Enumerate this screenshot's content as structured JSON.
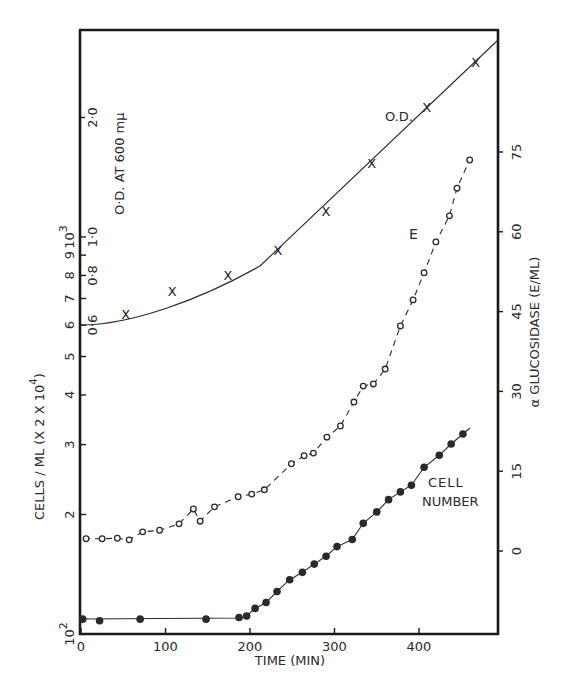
{
  "chart_data": {
    "type": "scatter",
    "title": "",
    "xlabel": "TIME (MIN)",
    "xlim": [
      0,
      494
    ],
    "x_ticks": [
      "0",
      "100",
      "200",
      "300",
      "400"
    ],
    "left_axis": {
      "label": "CELLS / ML (X 2 X 10⁴)",
      "scale": "log",
      "ticks": [
        "10²",
        "2",
        "3",
        "4",
        "5",
        "6",
        "7",
        "8",
        "9",
        "10³"
      ],
      "range": [
        100,
        3000
      ]
    },
    "od_axis": {
      "label": "O.D. AT 600 mμ",
      "scale": "log",
      "ticks": [
        "0.6",
        "0.8",
        "1.0",
        "2.0"
      ]
    },
    "right_axis": {
      "label": "α GLUCOSIDASE (E/ML)",
      "scale": "linear",
      "ticks": [
        "0",
        "15",
        "30",
        "45",
        "60",
        "75"
      ],
      "range": [
        -16,
        97
      ]
    },
    "annotations": [
      "O.D.",
      "E",
      "CELL",
      "NUMBER"
    ],
    "series": [
      {
        "name": "O.D.",
        "marker": "x",
        "axis": "od",
        "line": "solid",
        "points": [
          [
            53,
            0.64
          ],
          [
            108,
            0.73
          ],
          [
            174,
            0.8
          ],
          [
            233,
            0.93
          ],
          [
            290,
            1.16
          ],
          [
            344,
            1.54
          ],
          [
            409,
            2.12
          ],
          [
            467,
            2.76
          ]
        ]
      },
      {
        "name": "E",
        "marker": "open-circle",
        "axis": "right",
        "line": "dashed",
        "points": [
          [
            6,
            2.3
          ],
          [
            25,
            2.3
          ],
          [
            43,
            2.4
          ],
          [
            57,
            2.1
          ],
          [
            73,
            3.6
          ],
          [
            93,
            3.9
          ],
          [
            116,
            5.1
          ],
          [
            133,
            7.9
          ],
          [
            141,
            5.6
          ],
          [
            158,
            8.3
          ],
          [
            186,
            10.2
          ],
          [
            202,
            10.7
          ],
          [
            217,
            11.5
          ],
          [
            249,
            16.4
          ],
          [
            264,
            17.9
          ],
          [
            275,
            18.4
          ],
          [
            291,
            21.4
          ],
          [
            307,
            23.5
          ],
          [
            323,
            28.0
          ],
          [
            334,
            31.0
          ],
          [
            346,
            31.4
          ],
          [
            360,
            34.2
          ],
          [
            378,
            42.3
          ],
          [
            393,
            47.2
          ],
          [
            406,
            52.3
          ],
          [
            420,
            58.1
          ],
          [
            436,
            63.0
          ],
          [
            445,
            68.2
          ],
          [
            460,
            73.5
          ]
        ]
      },
      {
        "name": "CELL NUMBER",
        "marker": "filled-circle",
        "axis": "left",
        "line": "solid",
        "points": [
          [
            2,
            109
          ],
          [
            22,
            108
          ],
          [
            70,
            109
          ],
          [
            148,
            109
          ],
          [
            187,
            110
          ],
          [
            196,
            111
          ],
          [
            206,
            116
          ],
          [
            219,
            120
          ],
          [
            232,
            128
          ],
          [
            247,
            137
          ],
          [
            262,
            143
          ],
          [
            276,
            150
          ],
          [
            290,
            157
          ],
          [
            303,
            166
          ],
          [
            321,
            173
          ],
          [
            334,
            190
          ],
          [
            350,
            203
          ],
          [
            364,
            218
          ],
          [
            378,
            228
          ],
          [
            391,
            237
          ],
          [
            406,
            263
          ],
          [
            424,
            282
          ],
          [
            438,
            301
          ],
          [
            452,
            319
          ]
        ]
      }
    ]
  },
  "labels": {
    "xlabel": "TIME (MIN)",
    "left_axis_label": "CELLS / ML  (X 2 X 10",
    "left_axis_exp": "4",
    "left_axis_close": ")",
    "od_axis_label": "O·D. AT 600 mμ",
    "right_axis_label": "α GLUCOSIDASE  (E/ML)",
    "od_series": "O.D.",
    "e_series": "E",
    "cell_line1": "CELL",
    "cell_line2": "NUMBER"
  }
}
